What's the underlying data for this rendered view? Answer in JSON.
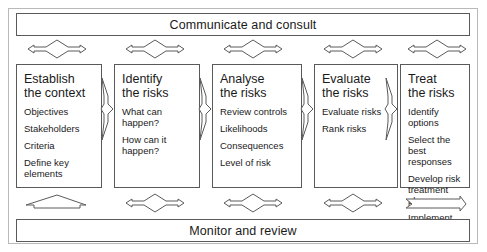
{
  "diagram": {
    "top_banner": "Communicate and consult",
    "bottom_banner": "Monitor and review",
    "stages": [
      {
        "title": "Establish\nthe context",
        "items": [
          "Objectives",
          "Stakeholders",
          "Criteria",
          "Define key\nelements"
        ]
      },
      {
        "title": "Identify\nthe risks",
        "items": [
          "What can\nhappen?",
          "How can it\nhappen?"
        ]
      },
      {
        "title": "Analyse\nthe risks",
        "items": [
          "Review controls",
          "Likelihoods",
          "Consequences",
          "Level of risk"
        ]
      },
      {
        "title": "Evaluate\nthe risks",
        "items": [
          "Evaluate risks",
          "Rank risks"
        ]
      },
      {
        "title": "Treat\nthe risks",
        "items": [
          "Identify options",
          "Select the best\nresponses",
          "Develop risk\ntreatment plans",
          "Implement"
        ]
      }
    ],
    "connector_icons": {
      "vertical_between_stages": "arrow-right-icon",
      "to_top_banner": "double-arrow-vertical-icon",
      "to_bottom_banner": "double-arrow-vertical-icon"
    },
    "colors": {
      "line": "#5a5a5a",
      "frame": "#b9b9b9",
      "text": "#1a1a1a",
      "background": "#ffffff"
    }
  }
}
